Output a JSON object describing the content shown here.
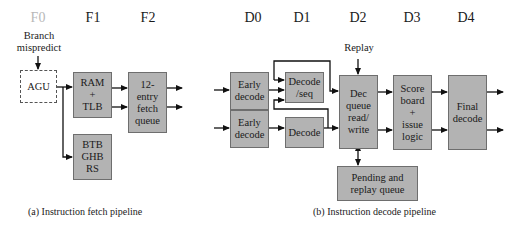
{
  "stages": {
    "fetch": [
      "F0",
      "F1",
      "F2"
    ],
    "decode": [
      "D0",
      "D1",
      "D2",
      "D3",
      "D4"
    ]
  },
  "inputs": {
    "branch_mispredict": "Branch\nmispredict",
    "replay": "Replay"
  },
  "blocks": {
    "agu": "AGU",
    "ram_tlb": "RAM\n+\nTLB",
    "fetch_queue": "12-\nentry\nfetch\nqueue",
    "btb": "BTB\nGHB\nRS",
    "early_decode_1": "Early\ndecode",
    "early_decode_2": "Early\ndecode",
    "decode_seq": "Decode\n/seq",
    "decode": "Decode",
    "dec_queue": "Dec\nqueue\nread/\nwrite",
    "scoreboard": "Score\nboard\n+\nissue\nlogic",
    "final_decode": "Final\ndecode",
    "pending_replay": "Pending and\nreplay queue"
  },
  "captions": {
    "fetch": "(a) Instruction fetch pipeline",
    "decode": "(b) Instruction decode pipeline"
  },
  "colors": {
    "block_fill": "#b3b3b3",
    "block_border": "#6e6e6e",
    "dim_stage": "#b8b8b8"
  }
}
